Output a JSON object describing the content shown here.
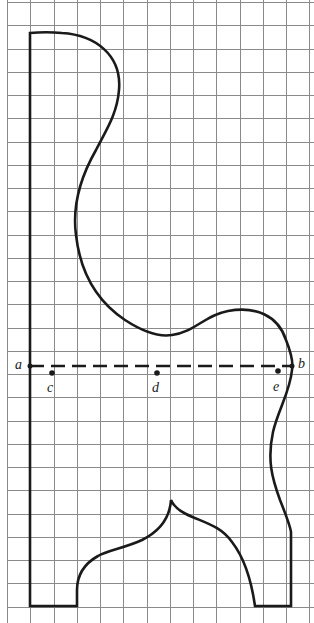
{
  "diagram": {
    "title": "",
    "grid": {
      "origin_x": 7,
      "origin_y": 2,
      "spacing": 23.25,
      "cols": 13,
      "rows": 26,
      "color": "#8a8a8a"
    },
    "shape": {
      "name": "irregular-outline",
      "stroke": "#1a1a1a"
    },
    "line_ab": {
      "from_label": "a",
      "to_label": "b",
      "style": "dashed"
    },
    "labels": {
      "a": "a",
      "b": "b",
      "c": "c",
      "d": "d",
      "e": "e"
    },
    "points": [
      {
        "label": "c",
        "x": 52,
        "y": 373
      },
      {
        "label": "d",
        "x": 157,
        "y": 373
      },
      {
        "label": "e",
        "x": 278,
        "y": 371
      }
    ]
  }
}
